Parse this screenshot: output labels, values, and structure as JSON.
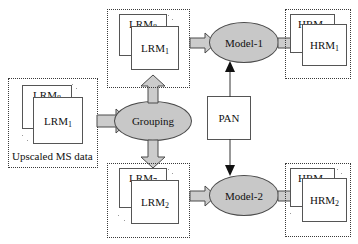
{
  "diagram": {
    "colors": {
      "ellipse_fill": "#c8c8c8",
      "arrow_fill": "#cccccc",
      "box_stroke": "#555555",
      "group_border": "#3a3a3a",
      "background": "#ffffff",
      "text": "#111111"
    },
    "input_group": {
      "caption": "Upscaled MS data",
      "back_box": {
        "base": "LRM",
        "sub": "8"
      },
      "front_box": {
        "base": "LRM",
        "sub": "1"
      }
    },
    "grouping_node": {
      "label": "Grouping"
    },
    "top_branch": {
      "input_group": {
        "back_box": {
          "base": "LRM",
          "sub": "8"
        },
        "front_box": {
          "base": "LRM",
          "sub": "1"
        }
      },
      "model": {
        "label": "Model-1"
      },
      "output_group": {
        "back_box": {
          "base": "HRM",
          "sub": "8"
        },
        "front_box": {
          "base": "HRM",
          "sub": "1"
        }
      }
    },
    "bottom_branch": {
      "input_group": {
        "back_box": {
          "base": "LRM",
          "sub": "7"
        },
        "front_box": {
          "base": "LRM",
          "sub": "2"
        }
      },
      "model": {
        "label": "Model-2"
      },
      "output_group": {
        "back_box": {
          "base": "HRM",
          "sub": "7"
        },
        "front_box": {
          "base": "HRM",
          "sub": "2"
        }
      }
    },
    "pan_node": {
      "label": "PAN"
    }
  }
}
